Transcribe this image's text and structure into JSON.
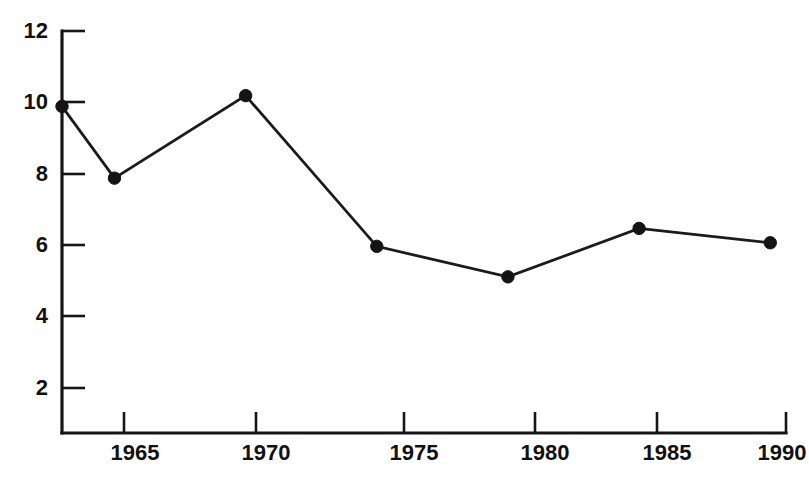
{
  "chart_data": {
    "type": "line",
    "title": "",
    "subtitle": "",
    "xlabel": "",
    "ylabel": "",
    "x": [
      1963,
      1965,
      1970,
      1975,
      1980,
      1985,
      1990
    ],
    "values": [
      9.9,
      7.9,
      10.2,
      6.0,
      5.15,
      6.5,
      6.1
    ],
    "series": [
      {
        "name": "",
        "values": [
          9.9,
          7.9,
          10.2,
          6.0,
          5.15,
          6.5,
          6.1
        ]
      }
    ],
    "xlim": [
      1963,
      1990.6
    ],
    "ylim": [
      0.8,
      12.0
    ],
    "xticks": [
      1965,
      1970,
      1975,
      1980,
      1985,
      1990
    ],
    "xtick_labels": [
      "1965",
      "1970",
      "1975",
      "1980",
      "1985",
      "1990"
    ],
    "yticks": [
      2,
      4,
      6,
      8,
      10,
      12
    ],
    "ytick_labels": [
      "2",
      "4",
      "6",
      "8",
      "10",
      "12"
    ],
    "grid": false,
    "legend": null,
    "legend_position": "none",
    "marker": "filled-circle",
    "line_color": "#1b1b1b",
    "marker_color": "#141414",
    "axis_color": "#161616",
    "background_color": "#ffffff",
    "annotations": []
  },
  "axes": {
    "y_axis_name": "y-axis",
    "x_axis_name": "x-axis"
  }
}
